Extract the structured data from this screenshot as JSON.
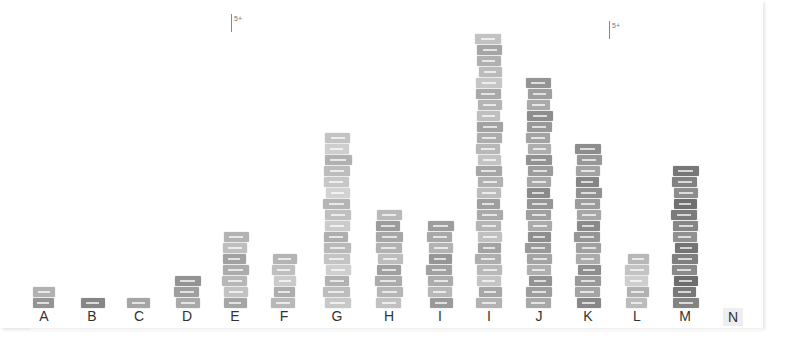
{
  "chart_data": {
    "type": "bar",
    "title": "",
    "xlabel": "",
    "ylabel": "",
    "grid": false,
    "legend": null,
    "note": "Physical bar chart built from stacked paper slips; values are estimated slip counts per column",
    "categories": [
      "A",
      "B",
      "C",
      "D",
      "E",
      "F",
      "G",
      "H",
      "I",
      "I",
      "J",
      "K",
      "L",
      "M",
      "N"
    ],
    "values": [
      2,
      1,
      1,
      3,
      7,
      5,
      16,
      9,
      8,
      25,
      21,
      15,
      5,
      13,
      0
    ],
    "ylim": [
      0,
      26
    ],
    "annotations": [
      {
        "text": "5+",
        "near": "E column (top)"
      },
      {
        "text": "5+",
        "near": "J/K columns (top)"
      }
    ]
  },
  "markers": [
    {
      "text": "5+",
      "x": 231,
      "y": 14
    },
    {
      "text": "5+",
      "x": 609,
      "y": 21
    }
  ],
  "columns": [
    {
      "label": "A",
      "x": 44,
      "width": 22,
      "count": 2,
      "tone": "#a8a8a8"
    },
    {
      "label": "B",
      "x": 92,
      "width": 22,
      "count": 1,
      "tone": "#8f8f8f"
    },
    {
      "label": "C",
      "x": 139,
      "width": 22,
      "count": 1,
      "tone": "#a3a3a3"
    },
    {
      "label": "D",
      "x": 187,
      "width": 24,
      "count": 3,
      "tone": "#9c9c9c"
    },
    {
      "label": "E",
      "x": 235,
      "width": 24,
      "count": 7,
      "tone": "#b5b5b5"
    },
    {
      "label": "F",
      "x": 284,
      "width": 22,
      "count": 5,
      "tone": "#bdbdbd"
    },
    {
      "label": "G",
      "x": 337,
      "width": 25,
      "count": 16,
      "tone": "#c2c2c2"
    },
    {
      "label": "H",
      "x": 389,
      "width": 25,
      "count": 9,
      "tone": "#b0b0b0"
    },
    {
      "label": "I",
      "x": 440,
      "width": 24,
      "count": 8,
      "tone": "#a6a6a6"
    },
    {
      "label": "I",
      "x": 489,
      "width": 24,
      "count": 25,
      "tone": "#b3b3b3"
    },
    {
      "label": "J",
      "x": 539,
      "width": 24,
      "count": 21,
      "tone": "#9e9e9e"
    },
    {
      "label": "K",
      "x": 588,
      "width": 24,
      "count": 15,
      "tone": "#9a9a9a"
    },
    {
      "label": "L",
      "x": 637,
      "width": 22,
      "count": 5,
      "tone": "#c4c4c4"
    },
    {
      "label": "M",
      "x": 685,
      "width": 24,
      "count": 13,
      "tone": "#808080"
    },
    {
      "label": "N",
      "x": 735,
      "width": 22,
      "count": 0,
      "tone": "#cccccc"
    }
  ]
}
